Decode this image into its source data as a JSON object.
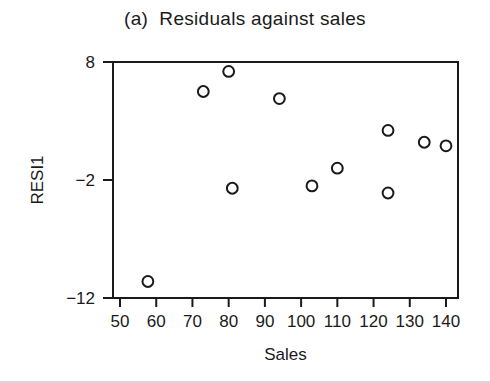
{
  "chart_data": {
    "type": "scatter",
    "title": "(a)  Residuals against sales",
    "xlabel": "Sales",
    "ylabel": "RESI1",
    "xlim": [
      48,
      143
    ],
    "ylim": [
      -13,
      8.8
    ],
    "xticks": [
      50,
      60,
      70,
      80,
      90,
      100,
      110,
      120,
      130,
      140
    ],
    "xtick_labels": [
      "50",
      "60",
      "70",
      "80",
      "90",
      "100",
      "110",
      "120",
      "130",
      "140"
    ],
    "yticks": [
      8,
      -2,
      -12
    ],
    "ytick_labels": [
      "8",
      "-2",
      "-12"
    ],
    "grid": false,
    "legend": null,
    "marker": "open-circle",
    "series": [
      {
        "name": "residuals",
        "x": [
          57.7,
          73.0,
          80.0,
          81.0,
          94.0,
          103.0,
          110.0,
          124.0,
          124.0,
          134.0,
          140.0
        ],
        "y": [
          -10.6,
          5.5,
          7.2,
          -2.7,
          4.9,
          -2.5,
          -1.0,
          2.2,
          -3.1,
          1.2,
          0.9
        ]
      }
    ]
  },
  "figure": {
    "title_text": "(a)  Residuals against sales",
    "x_axis_title": "Sales",
    "y_axis_title": "RESI1",
    "axis_color": "#1a1a1a",
    "marker_color": "#1a1a1a",
    "background_color": "#ffffff"
  }
}
